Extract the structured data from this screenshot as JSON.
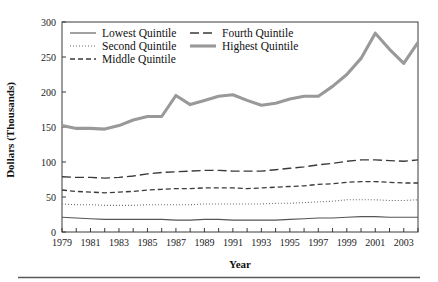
{
  "figure": {
    "background": "#ffffff",
    "separator_color": "#5a5a5a"
  },
  "chart_data": {
    "type": "line",
    "title": "",
    "xlabel": "Year",
    "ylabel": "Dollars (Thousands)",
    "xlim": [
      1979,
      2004
    ],
    "ylim": [
      0,
      300
    ],
    "yticks": [
      0,
      50,
      100,
      150,
      200,
      250,
      300
    ],
    "ytick_labels": [
      "0",
      "50",
      "100",
      "150",
      "200",
      "250",
      "300"
    ],
    "xticks": [
      1979,
      1980,
      1981,
      1982,
      1983,
      1984,
      1985,
      1986,
      1987,
      1988,
      1989,
      1990,
      1991,
      1992,
      1993,
      1994,
      1995,
      1996,
      1997,
      1998,
      1999,
      2000,
      2001,
      2002,
      2003,
      2004
    ],
    "xtick_labels": [
      "1979",
      "1981",
      "1983",
      "1985",
      "1987",
      "1989",
      "1991",
      "1993",
      "1995",
      "1997",
      "1999",
      "2001",
      "2003"
    ],
    "xtick_labeled_years": [
      1979,
      1981,
      1983,
      1985,
      1987,
      1989,
      1991,
      1993,
      1995,
      1997,
      1999,
      2001,
      2003
    ],
    "grid": false,
    "legend_position": "top-left-inside",
    "x": [
      1979,
      1980,
      1981,
      1982,
      1983,
      1984,
      1985,
      1986,
      1987,
      1988,
      1989,
      1990,
      1991,
      1992,
      1993,
      1994,
      1995,
      1996,
      1997,
      1998,
      1999,
      2000,
      2001,
      2002,
      2003,
      2004
    ],
    "series": [
      {
        "name": "Lowest Quintile",
        "style": "solid-thin",
        "color": "#555555",
        "width": 1.1,
        "dash": "none",
        "values": [
          21,
          20,
          19,
          18,
          18,
          18,
          18,
          18,
          17,
          17,
          18,
          18,
          17,
          17,
          17,
          17,
          18,
          19,
          20,
          20,
          21,
          22,
          22,
          21,
          21,
          21
        ]
      },
      {
        "name": "Second Quintile",
        "style": "dotted",
        "color": "#6a6a6a",
        "width": 1.1,
        "dash": "1,2",
        "values": [
          40,
          39,
          39,
          38,
          38,
          38,
          39,
          39,
          39,
          39,
          40,
          40,
          40,
          40,
          40,
          41,
          41,
          42,
          43,
          44,
          46,
          46,
          46,
          45,
          45,
          46
        ]
      },
      {
        "name": "Middle Quintile",
        "style": "dashed-short",
        "color": "#3a3a3a",
        "width": 1.3,
        "dash": "5,3",
        "values": [
          60,
          58,
          57,
          56,
          57,
          58,
          60,
          61,
          62,
          62,
          63,
          63,
          63,
          62,
          63,
          64,
          65,
          66,
          68,
          69,
          71,
          72,
          72,
          71,
          70,
          70
        ]
      },
      {
        "name": "Fourth Quintile",
        "style": "dashed-long",
        "color": "#3a3a3a",
        "width": 1.4,
        "dash": "9,4",
        "values": [
          79,
          78,
          78,
          77,
          78,
          80,
          83,
          85,
          86,
          87,
          88,
          88,
          87,
          87,
          87,
          89,
          91,
          93,
          96,
          98,
          101,
          103,
          103,
          102,
          101,
          103
        ]
      },
      {
        "name": "Highest Quintile",
        "style": "solid-thick",
        "color": "#999999",
        "width": 3.1,
        "dash": "none",
        "values": [
          152,
          148,
          148,
          147,
          152,
          160,
          165,
          165,
          195,
          182,
          188,
          194,
          196,
          188,
          181,
          184,
          190,
          194,
          194,
          208,
          225,
          248,
          284,
          261,
          241,
          271
        ]
      }
    ],
    "legend": [
      {
        "label": "Lowest Quintile",
        "style": "solid-thin",
        "color": "#555555",
        "column": 0,
        "row": 0
      },
      {
        "label": "Second Quintile",
        "style": "dotted",
        "color": "#6a6a6a",
        "column": 0,
        "row": 1
      },
      {
        "label": "Middle Quintile",
        "style": "dashed-short",
        "color": "#3a3a3a",
        "column": 0,
        "row": 2
      },
      {
        "label": "Fourth Quintile",
        "style": "dashed-long",
        "color": "#3a3a3a",
        "column": 1,
        "row": 0
      },
      {
        "label": "Highest Quintile",
        "style": "solid-thick",
        "color": "#999999",
        "column": 1,
        "row": 1
      }
    ]
  }
}
